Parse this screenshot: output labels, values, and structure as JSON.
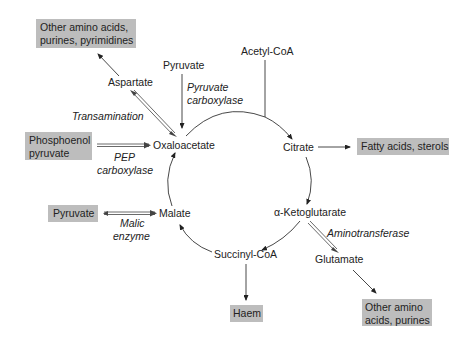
{
  "diagram": {
    "title": "",
    "cycle_nodes": {
      "oxaloacetate": "Oxaloacetate",
      "citrate": "Citrate",
      "alpha_ketoglutarate": "α-Ketoglutarate",
      "succinyl_coa": "Succinyl-CoA",
      "malate": "Malate"
    },
    "inputs": {
      "pyruvate_top": "Pyruvate",
      "acetyl_coa": "Acetyl-CoA",
      "aspartate": "Aspartate",
      "glutamate": "Glutamate"
    },
    "enzymes": {
      "pyruvate_carboxylase_1": "Pyruvate",
      "pyruvate_carboxylase_2": "carboxylase",
      "transamination": "Transamination",
      "pep_carboxylase_1": "PEP",
      "pep_carboxylase_2": "carboxylase",
      "malic_enzyme_1": "Malic",
      "malic_enzyme_2": "enzyme",
      "aminotransferase": "Aminotransferase"
    },
    "products": {
      "other_aa_purines_pyrimidines_1": "Other amino acids,",
      "other_aa_purines_pyrimidines_2": "purines, pyrimidines",
      "phosphoenol_pyruvate_1": "Phosphoenol",
      "phosphoenol_pyruvate_2": "pyruvate",
      "pyruvate_box": "Pyruvate",
      "fatty_acids_sterols": "Fatty acids, sterols",
      "haem": "Haem",
      "other_aa_purines_1": "Other amino",
      "other_aa_purines_2": "acids, purines"
    },
    "colors": {
      "box_fill": "#bdbdbd",
      "text": "#222222",
      "line": "#333333"
    }
  }
}
